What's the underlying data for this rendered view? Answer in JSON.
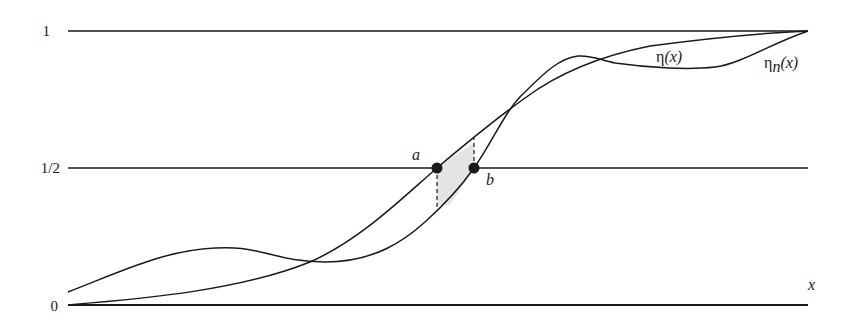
{
  "figure": {
    "y_ticks": [
      {
        "label": "1",
        "value": 1
      },
      {
        "label": "1/2",
        "value": 0.5
      },
      {
        "label": "0",
        "value": 0
      }
    ],
    "x_axis_label": "x",
    "points": {
      "a": "a",
      "b": "b"
    },
    "curves": {
      "eta": {
        "symbol": "η",
        "arg": "(x)",
        "subscript": ""
      },
      "eta_n": {
        "symbol": "η",
        "arg": "(x)",
        "subscript": "n"
      }
    },
    "colors": {
      "line": "#1a1a1a",
      "background": "#ffffff"
    }
  }
}
